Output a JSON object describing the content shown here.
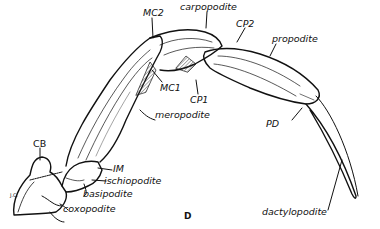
{
  "figure": {
    "letter": "D",
    "signature": "J.C.",
    "labels": {
      "mc2": "MC2",
      "carpopodite": "carpopodite",
      "cp2": "CP2",
      "propodite": "propodite",
      "mc1": "MC1",
      "cp1": "CP1",
      "meropodite": "meropodite",
      "pd": "PD",
      "cb": "CB",
      "im": "IM",
      "ischiopodite": "ischiopodite",
      "basipodite": "basipodite",
      "coxopodite": "coxopodite",
      "dactylopodite": "dactylopodite"
    }
  }
}
